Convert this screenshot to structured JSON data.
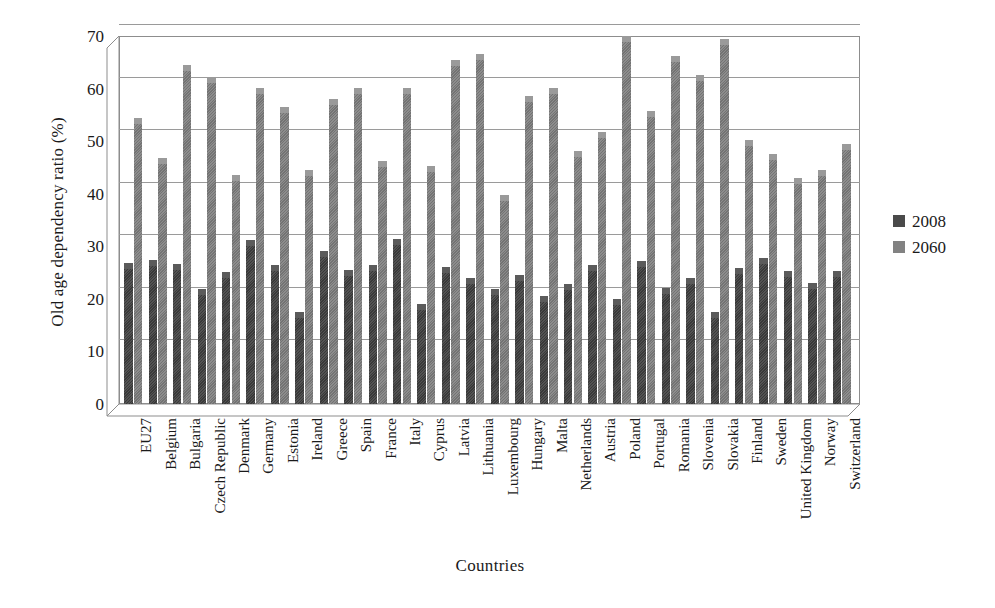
{
  "chart_data": {
    "type": "bar",
    "title": "",
    "xlabel": "Countries",
    "ylabel": "Old age dependency ratio (%)",
    "ylim": [
      0,
      70
    ],
    "yticks": [
      70,
      60,
      50,
      40,
      30,
      20,
      10,
      0
    ],
    "grid": true,
    "legend_position": "right",
    "categories": [
      "EU27",
      "Belgium",
      "Bulgaria",
      "Czech Republic",
      "Denmark",
      "Germany",
      "Estonia",
      "Ireland",
      "Greece",
      "Spain",
      "France",
      "Italy",
      "Cyprus",
      "Latvia",
      "Lithuania",
      "Luxembourg",
      "Hungary",
      "Malta",
      "Netherlands",
      "Austria",
      "Poland",
      "Portugal",
      "Romania",
      "Slovenia",
      "Slovakia",
      "Finland",
      "Sweden",
      "United Kingdom",
      "Norway",
      "Switzerland"
    ],
    "series": [
      {
        "name": "2008",
        "color": "#404040",
        "values": [
          25.9,
          26.4,
          25.6,
          20.9,
          24.1,
          30.3,
          25.4,
          16.6,
          28.2,
          24.6,
          25.5,
          30.4,
          18.0,
          25.2,
          23.1,
          20.9,
          23.5,
          19.6,
          21.8,
          25.4,
          19.0,
          26.3,
          21.2,
          23.1,
          16.6,
          25.0,
          26.8,
          24.3,
          22.0,
          24.4
        ]
      },
      {
        "name": "2060",
        "color": "#7d7d7d",
        "values": [
          53.5,
          45.8,
          63.5,
          61.2,
          42.7,
          59.1,
          55.6,
          43.6,
          57.1,
          59.1,
          45.2,
          59.2,
          44.4,
          64.5,
          65.7,
          38.9,
          57.6,
          59.1,
          47.2,
          50.7,
          69.0,
          54.8,
          65.3,
          61.6,
          68.5,
          49.3,
          46.7,
          42.1,
          43.5,
          48.5
        ]
      }
    ]
  },
  "legend": {
    "items": [
      {
        "label": "2008",
        "color": "#4a4a4a"
      },
      {
        "label": "2060",
        "color": "#828282"
      }
    ]
  },
  "axes": {
    "y_title": "Old age dependency ratio (%)",
    "x_title": "Countries"
  }
}
